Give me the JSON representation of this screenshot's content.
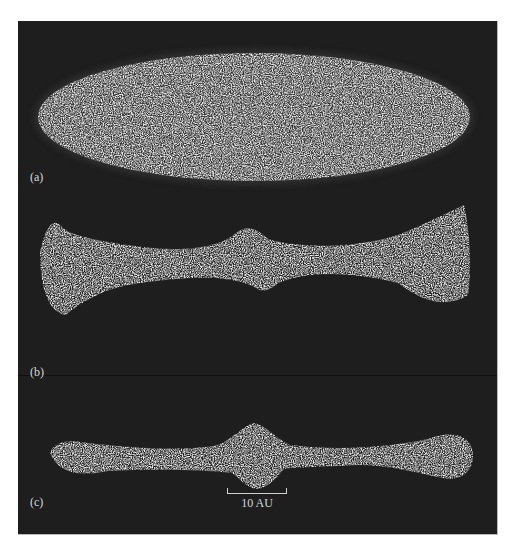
{
  "figure": {
    "panels": [
      {
        "label": "(a)",
        "shape": "ellipse"
      },
      {
        "label": "(b)",
        "shape": "bone-thick"
      },
      {
        "label": "(c)",
        "shape": "bone-thin"
      }
    ],
    "scalebar": {
      "label": "10 AU"
    },
    "colors": {
      "background": "#1e1e1e",
      "particles": "#d9d9d9",
      "page": "#ffffff"
    }
  }
}
